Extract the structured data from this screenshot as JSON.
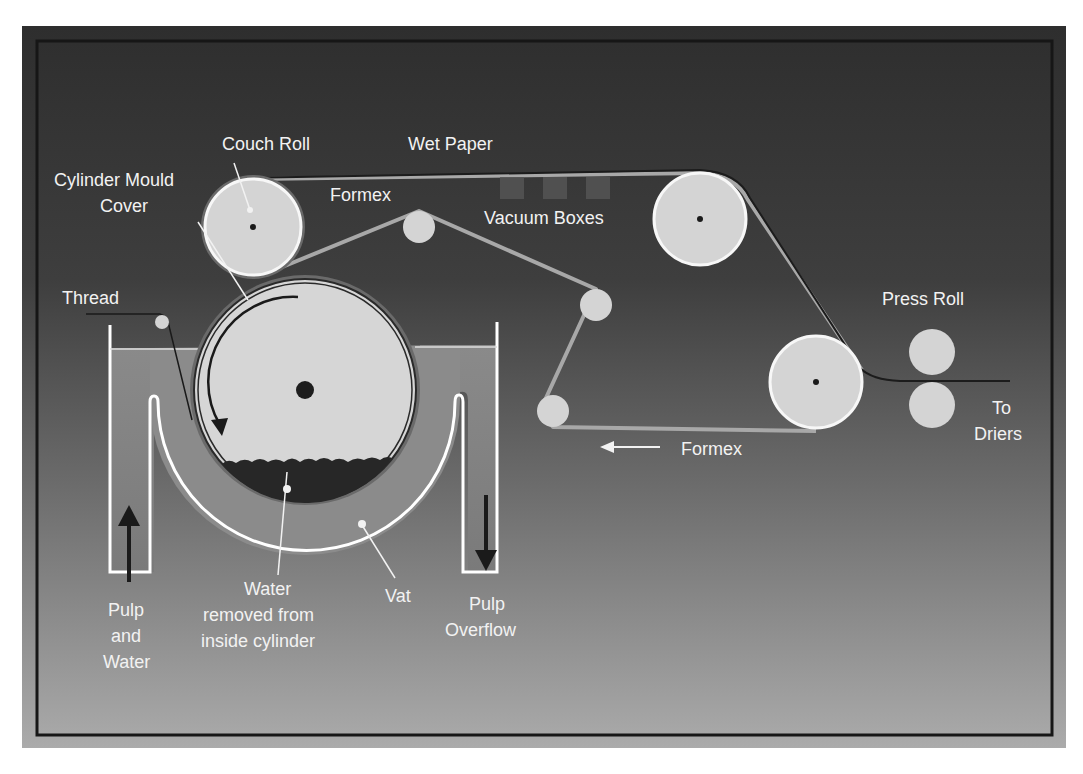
{
  "diagram": {
    "type": "cylinder-mould paper machine schematic",
    "colors": {
      "panel_top": "#2f2f2f",
      "panel_bottom": "#a9a9a9",
      "border": "#1a1a1a",
      "roll_fill": "#d6d6d6",
      "roll_rim": "#f5f5f5",
      "felt": "#9a9a9a",
      "wet_paper": "#1c1c1c",
      "pulp": "#8c8c8c",
      "water": "#2a2a2a",
      "vat_wall": "#ffffff",
      "label": "#f2f2f2"
    },
    "labels": {
      "couch_roll": "Couch Roll",
      "wet_paper": "Wet Paper",
      "cylinder_mould_cover_1": "Cylinder Mould",
      "cylinder_mould_cover_2": "Cover",
      "formex_top": "Formex",
      "vacuum_boxes": "Vacuum Boxes",
      "thread": "Thread",
      "press_roll": "Press Roll",
      "to_driers_1": "To",
      "to_driers_2": "Driers",
      "formex_bottom": "Formex",
      "pulp_and_water_1": "Pulp",
      "pulp_and_water_2": "and",
      "pulp_and_water_3": "Water",
      "water_removed_1": "Water",
      "water_removed_2": "removed from",
      "water_removed_3": "inside cylinder",
      "vat": "Vat",
      "pulp_overflow_1": "Pulp",
      "pulp_overflow_2": "Overflow"
    },
    "components": [
      {
        "name": "Cylinder Mould",
        "shape": "circle",
        "cx": 305,
        "cy": 390,
        "r": 110
      },
      {
        "name": "Couch Roll",
        "shape": "circle",
        "cx": 253,
        "cy": 227,
        "r": 48
      },
      {
        "name": "Formex guide roll 1",
        "shape": "circle",
        "cx": 419,
        "cy": 227,
        "r": 16
      },
      {
        "name": "Formex guide roll 2",
        "shape": "circle",
        "cx": 596,
        "cy": 305,
        "r": 16
      },
      {
        "name": "Formex guide roll 3",
        "shape": "circle",
        "cx": 553,
        "cy": 411,
        "r": 16
      },
      {
        "name": "Upper felt roll",
        "shape": "circle",
        "cx": 700,
        "cy": 219,
        "r": 46
      },
      {
        "name": "Lower felt roll",
        "shape": "circle",
        "cx": 816,
        "cy": 382,
        "r": 46
      },
      {
        "name": "Press Roll top",
        "shape": "circle",
        "cx": 932,
        "cy": 352,
        "r": 23
      },
      {
        "name": "Press Roll bottom",
        "shape": "circle",
        "cx": 932,
        "cy": 405,
        "r": 23
      },
      {
        "name": "Vacuum Boxes",
        "count": 3
      }
    ]
  }
}
